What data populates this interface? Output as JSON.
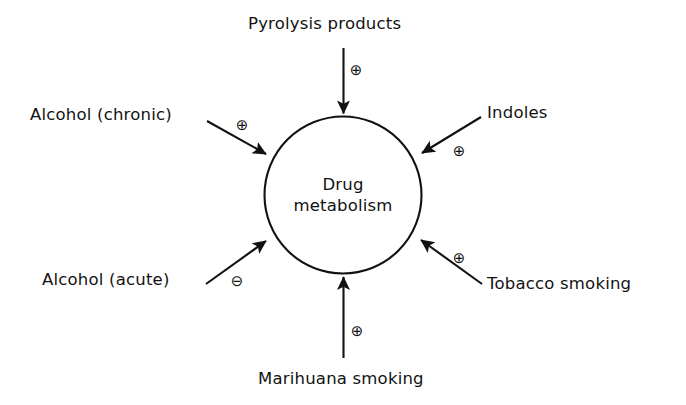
{
  "figure": {
    "center_node": {
      "line1": "Drug",
      "line2": "metabolism",
      "shape": "circle"
    },
    "ink_color": "#111111",
    "background_color": "#ffffff",
    "influences": [
      {
        "id": "pyrolysis-products",
        "label": "Pyrolysis products",
        "sign": "⊕",
        "sign_name": "plus-circle-icon",
        "effect": "increase",
        "direction": "top-to-center"
      },
      {
        "id": "alcohol-chronic",
        "label": "Alcohol (chronic)",
        "sign": "⊕",
        "sign_name": "plus-circle-icon",
        "effect": "increase",
        "direction": "upper-left-to-center"
      },
      {
        "id": "indoles",
        "label": "Indoles",
        "sign": "⊕",
        "sign_name": "plus-circle-icon",
        "effect": "increase",
        "direction": "upper-right-to-center"
      },
      {
        "id": "alcohol-acute",
        "label": "Alcohol (acute)",
        "sign": "⊖",
        "sign_name": "minus-circle-icon",
        "effect": "decrease",
        "direction": "lower-left-to-center"
      },
      {
        "id": "tobacco-smoking",
        "label": "Tobacco smoking",
        "sign": "⊕",
        "sign_name": "plus-circle-icon",
        "effect": "increase",
        "direction": "lower-right-to-center"
      },
      {
        "id": "marihuana-smoking",
        "label": "Marihuana smoking",
        "sign": "⊕",
        "sign_name": "plus-circle-icon",
        "effect": "increase",
        "direction": "bottom-to-center"
      }
    ]
  }
}
